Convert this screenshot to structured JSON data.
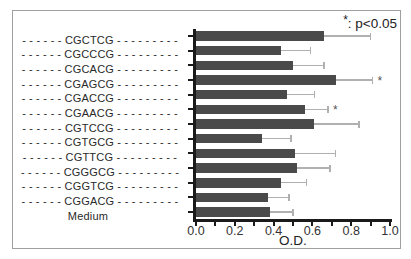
{
  "figure": {
    "annotation": {
      "star": "*",
      "text": ": p<0.05"
    },
    "xlabel": "O.D."
  },
  "chart_data": {
    "type": "bar",
    "orientation": "horizontal",
    "title": "",
    "xlabel": "O.D.",
    "ylabel": "",
    "xlim": [
      0.0,
      1.0
    ],
    "grid": false,
    "legend_position": "none",
    "annotation": "*: p<0.05",
    "categories": [
      "CGCTCG",
      "CGCCCG",
      "CGCACG",
      "CGAGCG",
      "CGACCG",
      "CGAACG",
      "CGTCCG",
      "CGTGCG",
      "CGTTCG",
      "CGGGCG",
      "CGGTCG",
      "CGGACG",
      "Medium"
    ],
    "display_labels": [
      "- - - - - - CGCTCG - - - - - - - - -",
      "- - - - - - CGCCCG - - - - - - - - -",
      "- - - - - - CGCACG - - - - - - - - -",
      "- - - - - - CGAGCG - - - - - - - - -",
      "- - - - - - CGACCG - - - - - - - - -",
      "- - - - - - CGAACG - - - - - - - - -",
      "- - - - - - CGTCCG - - - - - - - - -",
      "- - - - - - CGTGCG - - - - - - - - -",
      "- - - - - - CGTTCG - - - - - - - - -",
      "- - - - - - CGGGCG - - - - - - - - -",
      "- - - - - - CGGTCG - - - - - - - - -",
      "- - - - - - CGGACG - - - - - - - - -",
      "Medium"
    ],
    "values": [
      0.66,
      0.44,
      0.5,
      0.72,
      0.47,
      0.56,
      0.61,
      0.34,
      0.51,
      0.52,
      0.44,
      0.37,
      0.38
    ],
    "errors_upper": [
      0.24,
      0.15,
      0.16,
      0.19,
      0.14,
      0.12,
      0.23,
      0.15,
      0.21,
      0.17,
      0.13,
      0.11,
      0.12
    ],
    "significant": [
      false,
      false,
      false,
      true,
      false,
      true,
      false,
      false,
      false,
      false,
      false,
      false,
      false
    ],
    "significance_marker": "*",
    "x_major_tick_labels": [
      "0.0",
      "0.2",
      "0.4",
      "0.6",
      "0.8",
      "1.0"
    ],
    "x_minor_tick_interval": 0.1,
    "colors": {
      "bar": "#4a4a4a",
      "error_bar": "#b0b0b0",
      "axis": "#1a1a1a",
      "text": "#222222",
      "frame": "#a0a0a0",
      "background": "#ffffff"
    }
  }
}
